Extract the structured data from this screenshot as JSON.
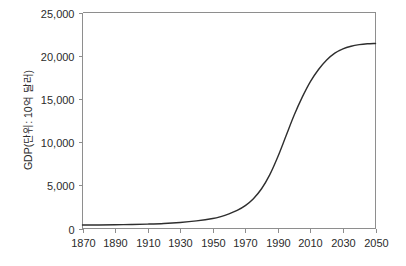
{
  "chart_data": {
    "type": "line",
    "title": "",
    "subtitle": "",
    "xlabel": "",
    "ylabel": "GDP(단위: 10억 달러)",
    "xlim": [
      1870,
      2050
    ],
    "ylim": [
      0,
      25000
    ],
    "grid": false,
    "legend": false,
    "legend_position": "none",
    "x_tick_labels": [
      "1870",
      "1890",
      "1910",
      "1930",
      "1950",
      "1970",
      "1990",
      "2010",
      "2030",
      "2050"
    ],
    "x_ticks": [
      1870,
      1890,
      1910,
      1930,
      1950,
      1970,
      1990,
      2010,
      2030,
      2050
    ],
    "y_tick_labels": [
      "0",
      "5,000",
      "10,000",
      "15,000",
      "20,000",
      "25,000"
    ],
    "y_ticks": [
      0,
      5000,
      10000,
      15000,
      20000,
      25000
    ],
    "series": [
      {
        "name": "GDP",
        "color": "#2e2e2e",
        "x": [
          1870,
          1880,
          1890,
          1900,
          1910,
          1920,
          1930,
          1940,
          1950,
          1955,
          1960,
          1965,
          1970,
          1975,
          1980,
          1985,
          1990,
          1995,
          2000,
          2005,
          2010,
          2015,
          2020,
          2025,
          2030,
          2035,
          2040,
          2045,
          2050
        ],
        "values": [
          400,
          410,
          430,
          460,
          510,
          580,
          700,
          880,
          1150,
          1380,
          1700,
          2100,
          2650,
          3450,
          4600,
          6200,
          8300,
          10700,
          13100,
          15200,
          17000,
          18400,
          19500,
          20300,
          20800,
          21100,
          21280,
          21380,
          21420
        ]
      }
    ],
    "annotations": []
  },
  "axes": {
    "y_axis_name": "y-axis",
    "x_axis_name": "x-axis",
    "frame_color": "#8e8e8e",
    "text_color": "#2b2b2b"
  }
}
